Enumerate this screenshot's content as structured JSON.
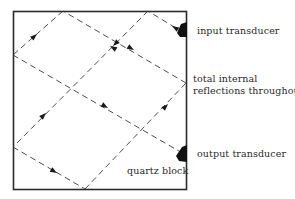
{
  "diagram": {
    "labels": {
      "input_transducer": "input transducer",
      "total_internal_line1": "total internal",
      "total_internal_line2": "reflections throughout",
      "output_transducer": "output transducer",
      "quartz_block": "quartz block"
    },
    "colors": {
      "outline": "#2b2b2b",
      "ray": "#3a3a3a",
      "transducer": "#111111"
    }
  }
}
